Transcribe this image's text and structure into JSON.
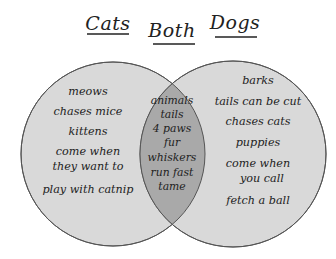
{
  "diagram": {
    "type": "venn",
    "colors": {
      "background": "#ffffff",
      "circle_fill": "#d9d9d9",
      "overlap_fill": "#a9a9a9",
      "outline": "#555555",
      "text": "#222222"
    },
    "headings": {
      "left": "Cats",
      "middle": "Both",
      "right": "Dogs"
    },
    "left_items": [
      "meows",
      "chases mice",
      "kittens",
      "come when",
      "they want to",
      "play with catnip"
    ],
    "both_items": [
      "animals",
      "tails",
      "4 paws",
      "fur",
      "whiskers",
      "run fast",
      "tame"
    ],
    "right_items": [
      "barks",
      "tails can be cut",
      "chases cats",
      "puppies",
      "come when",
      "you call",
      "fetch a ball"
    ]
  }
}
